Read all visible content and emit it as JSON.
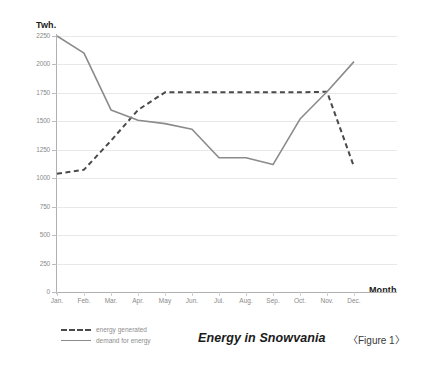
{
  "chart_data": {
    "type": "line",
    "title": "Energy in Snowvania",
    "caption": "〈Figure 1〉",
    "xlabel": "Month",
    "ylabel": "Twh.",
    "grid": true,
    "legend_position": "bottom-left",
    "ylim": [
      0,
      2250
    ],
    "yticks": [
      0,
      250,
      500,
      750,
      1000,
      1250,
      1500,
      1750,
      2000,
      2250
    ],
    "ytick_labels": [
      "0",
      "250",
      "500",
      "750",
      "1000",
      "1250",
      "1500",
      "1750",
      "2000",
      "2250"
    ],
    "categories": [
      "Jan.",
      "Feb.",
      "Mar.",
      "Apr.",
      "May",
      "Jun.",
      "Jul.",
      "Aug.",
      "Sep.",
      "Oct.",
      "Nov.",
      "Dec."
    ],
    "series": [
      {
        "name": "energy generated",
        "style": "dashed",
        "color": "#4a4a4a",
        "values": [
          1040,
          1075,
          1330,
          1600,
          1755,
          1755,
          1755,
          1755,
          1755,
          1755,
          1760,
          1100
        ]
      },
      {
        "name": "demand for energy",
        "style": "solid",
        "color": "#8b8b8b",
        "values": [
          2250,
          2100,
          1600,
          1510,
          1480,
          1430,
          1180,
          1180,
          1120,
          1520,
          1760,
          2025
        ]
      }
    ]
  },
  "colors": {
    "generated": "#4a4a4a",
    "demand": "#8b8b8b",
    "grid": "#e8e8e8",
    "axis": "#b0b0b0",
    "tick_text": "#8a8a8a",
    "title_text": "#1a1a1a"
  }
}
